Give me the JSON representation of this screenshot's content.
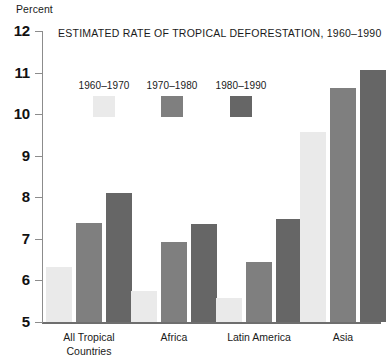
{
  "chart_data": {
    "type": "bar",
    "title": "ESTIMATED RATE OF TROPICAL DEFORESTATION, 1960–1990",
    "xlabel": "",
    "ylabel": "Percent",
    "ylim": [
      5,
      12
    ],
    "ytick_labels": [
      "12",
      "11",
      "10",
      "9",
      "8",
      "7",
      "6",
      "5"
    ],
    "yticks": [
      12,
      11,
      10,
      9,
      8,
      7,
      6,
      5
    ],
    "grid": false,
    "legend_position": "top-left-inside",
    "categories": [
      "All Tropical\nCountries",
      "Africa",
      "Latin America",
      "Asia"
    ],
    "series": [
      {
        "name": "1960–1970",
        "color": "#eaeaea",
        "values": [
          6.32,
          5.74,
          5.58,
          9.58
        ]
      },
      {
        "name": "1970–1980",
        "color": "#7f7f7f",
        "values": [
          7.37,
          6.92,
          6.45,
          10.62
        ]
      },
      {
        "name": "1980–1990",
        "color": "#666666",
        "values": [
          8.1,
          7.36,
          7.48,
          11.06
        ]
      }
    ]
  },
  "axis": {
    "unit_label": "Percent"
  },
  "colors": {
    "axis_line": "#8c8c8c",
    "baseline": "#6e6e6e",
    "text": "#1a1a1a",
    "series_1960_1970": "#eaeaea",
    "series_1970_1980": "#7f7f7f",
    "series_1980_1990": "#666666",
    "background": "#ffffff"
  }
}
